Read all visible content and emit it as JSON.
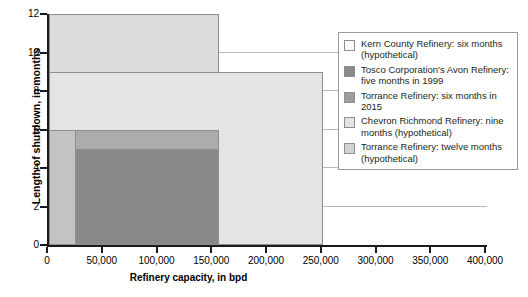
{
  "chart_data": {
    "type": "bar",
    "title": "",
    "subtitle": "",
    "xlabel": "Refinery capacity, in bpd",
    "ylabel": "Length of shutdown, in months",
    "xlim": [
      0,
      400000
    ],
    "ylim": [
      0,
      12
    ],
    "grid": true,
    "legend_position": "right-inside",
    "orientation": "overlapping-horizontal-extent-bars",
    "xticks": [
      0,
      50000,
      100000,
      150000,
      200000,
      250000,
      300000,
      350000,
      400000
    ],
    "xticklabels": [
      "0",
      "50,000",
      "100,000",
      "150,000",
      "200,000",
      "250,000",
      "300,000",
      "350,000",
      "400,000"
    ],
    "yticks": [
      0,
      2,
      4,
      6,
      8,
      10,
      12
    ],
    "yticklabels": [
      "0",
      "2",
      "4",
      "6",
      "8",
      "10",
      "12"
    ],
    "series": [
      {
        "name": "Torrance Refinery: twelve months (hypothetical)",
        "x_start": 0,
        "x_end": 155000,
        "value": 12,
        "color": "#dcdcdc",
        "units": "months",
        "draw_order": 1
      },
      {
        "name": "Chevron Richmond Refinery: nine months (hypothetical)",
        "x_start": 0,
        "x_end": 250000,
        "value": 9,
        "color": "#e4e4e4",
        "units": "months",
        "draw_order": 2
      },
      {
        "name": "Torrance Refinery: six months in 2015",
        "x_start": 0,
        "x_end": 155000,
        "value": 6,
        "color": "#acacac",
        "units": "months",
        "draw_order": 3
      },
      {
        "name": "Kern County Refinery: six months (hypothetical)",
        "x_start": 0,
        "x_end": 25000,
        "value": 6,
        "color": "#c3c3c3",
        "units": "months",
        "draw_order": 4
      },
      {
        "name": "Tosco Corporation's Avon Refinery: five months in 1999",
        "x_start": 25000,
        "x_end": 155000,
        "value": 5,
        "color": "#898989",
        "units": "months",
        "draw_order": 5
      }
    ],
    "annotations": []
  },
  "legend": {
    "items": [
      {
        "label": "Kern County Refinery: six months (hypothetical)",
        "color": "#fafafa"
      },
      {
        "label": "Tosco Corporation's Avon Refinery: five months in 1999",
        "color": "#8a8a8a"
      },
      {
        "label": "Torrance Refinery: six months in 2015",
        "color": "#9d9d9d"
      },
      {
        "label": "Chevron Richmond Refinery: nine months (hypothetical)",
        "color": "#e3e3e3"
      },
      {
        "label": "Torrance Refinery: twelve months (hypothetical)",
        "color": "#d2d2d2"
      }
    ]
  },
  "axes": {
    "x_title": "Refinery capacity, in bpd",
    "y_title": "Length of shutdown, in months"
  },
  "colors": {
    "axis": "#1a1a1a",
    "grid": "#b9b9b9",
    "bar_edge": "#8e8e8e",
    "background": "#ffffff",
    "text": "#231f20"
  }
}
